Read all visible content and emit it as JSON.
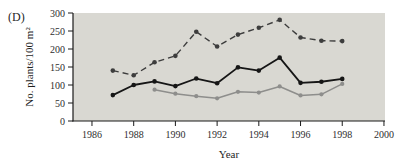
{
  "panel_label": "(D)",
  "chart_data": {
    "type": "line",
    "title": "",
    "xlabel": "Year",
    "ylabel": "No. plants/100 m²",
    "xlim": [
      1985.09,
      2000.05
    ],
    "ylim": [
      0,
      300
    ],
    "xticks": [
      1986,
      1988,
      1990,
      1992,
      1994,
      1996,
      1998,
      2000
    ],
    "yticks": [
      0,
      50,
      100,
      150,
      200,
      250,
      300
    ],
    "grid": false,
    "legend": "none",
    "plot_bg_color": "#d9d8d2",
    "axis_color": "#1a1a1a",
    "tick_label_color": "#2e2e2e",
    "series": [
      {
        "name": "upper-dashed",
        "line_style": "dashed",
        "color": "#3d3d3d",
        "line_width": 1.4,
        "marker": "circle",
        "marker_radius": 2.3,
        "x": [
          1987,
          1988,
          1989,
          1990,
          1991,
          1992,
          1993,
          1994,
          1995,
          1996,
          1997,
          1998
        ],
        "values": [
          140,
          127,
          163,
          181,
          248,
          207,
          240,
          259,
          281,
          232,
          223,
          222
        ]
      },
      {
        "name": "middle-solid-black",
        "line_style": "solid",
        "color": "#161616",
        "line_width": 1.8,
        "marker": "circle",
        "marker_radius": 2.3,
        "x": [
          1987,
          1988,
          1989,
          1990,
          1991,
          1992,
          1993,
          1994,
          1995,
          1996,
          1997,
          1998
        ],
        "values": [
          72,
          100,
          110,
          97,
          118,
          105,
          149,
          140,
          176,
          106,
          109,
          117
        ]
      },
      {
        "name": "lower-solid-gray",
        "line_style": "solid",
        "color": "#8e8e8c",
        "line_width": 1.5,
        "marker": "circle",
        "marker_radius": 2.1,
        "x": [
          1989,
          1990,
          1991,
          1992,
          1993,
          1994,
          1995,
          1996,
          1997,
          1998
        ],
        "values": [
          87,
          76,
          69,
          63,
          81,
          79,
          96,
          71,
          74,
          103
        ]
      }
    ]
  }
}
